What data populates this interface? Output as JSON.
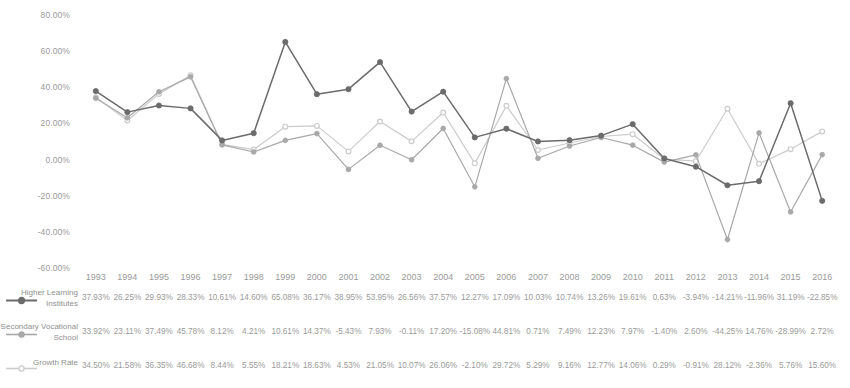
{
  "chart_data": {
    "type": "line",
    "title": "",
    "subtitle": "",
    "xlabel": "",
    "ylabel": "",
    "grid": false,
    "legend_position": "bottom-left-table",
    "x": [
      "1993",
      "1994",
      "1995",
      "1996",
      "1997",
      "1998",
      "1999",
      "2000",
      "2001",
      "2002",
      "2003",
      "2004",
      "2005",
      "2006",
      "2007",
      "2008",
      "2009",
      "2010",
      "2011",
      "2012",
      "2013",
      "2014",
      "2015",
      "2016"
    ],
    "categories": [
      "1993",
      "1994",
      "1995",
      "1996",
      "1997",
      "1998",
      "1999",
      "2000",
      "2001",
      "2002",
      "2003",
      "2004",
      "2005",
      "2006",
      "2007",
      "2008",
      "2009",
      "2010",
      "2011",
      "2012",
      "2013",
      "2014",
      "2015",
      "2016"
    ],
    "ylim": [
      -60,
      80
    ],
    "ytick_labels": [
      "80.00%",
      "60.00%",
      "40.00%",
      "20.00%",
      "0.00%",
      "-20.00%",
      "-40.00%",
      "-60.00%"
    ],
    "ytick_values": [
      80,
      60,
      40,
      20,
      0,
      -20,
      -40,
      -60
    ],
    "series": [
      {
        "name": "Higher Learning Institutes",
        "color": "#6b6b6b",
        "marker": "circle-filled",
        "values": [
          37.93,
          26.25,
          29.93,
          28.33,
          10.61,
          14.6,
          65.08,
          36.17,
          38.95,
          53.95,
          26.56,
          37.57,
          12.27,
          17.09,
          10.03,
          10.74,
          13.26,
          19.61,
          0.63,
          -3.94,
          -14.21,
          -11.96,
          31.19,
          -22.85
        ],
        "labels": [
          "37.93%",
          "26.25%",
          "29.93%",
          "28.33%",
          "10.61%",
          "14.60%",
          "65.08%",
          "36.17%",
          "38.95%",
          "53.95%",
          "26.56%",
          "37.57%",
          "12.27%",
          "17.09%",
          "10.03%",
          "10.74%",
          "13.26%",
          "19.61%",
          "0.63%",
          "-3.94%",
          "-14.21%",
          "-11.96%",
          "31.19%",
          "-22.85%"
        ]
      },
      {
        "name": "Secondary Vocational School",
        "color": "#a8a8a8",
        "marker": "circle-filled",
        "values": [
          33.92,
          23.11,
          37.49,
          45.78,
          8.12,
          4.21,
          10.61,
          14.37,
          -5.43,
          7.93,
          -0.11,
          17.2,
          -15.08,
          44.81,
          0.71,
          7.49,
          12.23,
          7.97,
          -1.4,
          2.6,
          -44.25,
          14.76,
          -28.99,
          2.72
        ],
        "labels": [
          "33.92%",
          "23.11%",
          "37.49%",
          "45.78%",
          "8.12%",
          "4.21%",
          "10.61%",
          "14.37%",
          "-5.43%",
          "7.93%",
          "-0.11%",
          "17.20%",
          "-15.08%",
          "44.81%",
          "0.71%",
          "7.49%",
          "12.23%",
          "7.97%",
          "-1.40%",
          "2.60%",
          "-44.25%",
          "14.76%",
          "-28.99%",
          "2.72%"
        ]
      },
      {
        "name": "Growth Rate",
        "color": "#cccccc",
        "marker": "circle-hollow",
        "values": [
          34.5,
          21.58,
          36.35,
          46.68,
          8.44,
          5.55,
          18.21,
          18.63,
          4.53,
          21.05,
          10.07,
          26.06,
          -2.1,
          29.72,
          5.29,
          9.16,
          12.77,
          14.06,
          0.29,
          -0.91,
          28.12,
          -2.36,
          5.76,
          15.6
        ],
        "labels": [
          "34.50%",
          "21.58%",
          "36.35%",
          "46.68%",
          "8.44%",
          "5.55%",
          "18.21%",
          "18.63%",
          "4.53%",
          "21.05%",
          "10.07%",
          "26.06%",
          "-2.10%",
          "29.72%",
          "5.29%",
          "9.16%",
          "12.77%",
          "14.06%",
          "0.29%",
          "-0.91%",
          "28.12%",
          "-2.36%",
          "5.76%",
          "15.60%"
        ]
      }
    ]
  },
  "legend": {
    "items": [
      {
        "label": "Higher Learning Institutes",
        "color": "#6b6b6b",
        "marker": "circle-filled"
      },
      {
        "label": "Secondary Vocational School",
        "color": "#a8a8a8",
        "marker": "circle-filled"
      },
      {
        "label": "Growth Rate",
        "color": "#cccccc",
        "marker": "circle-hollow"
      }
    ]
  }
}
